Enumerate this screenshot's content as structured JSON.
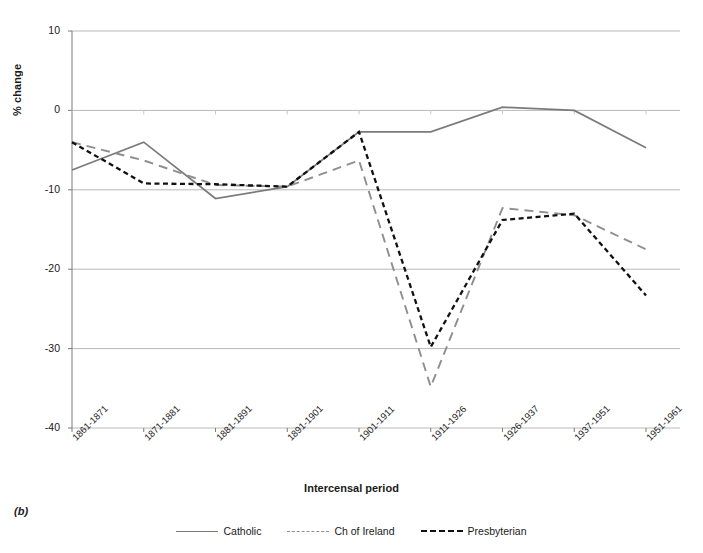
{
  "panel": {
    "letter": "(b)"
  },
  "chart_data": {
    "type": "line",
    "title": "",
    "xlabel": "Intercensal period",
    "ylabel": "% change",
    "categories": [
      "1861-1871",
      "1871-1881",
      "1881-1891",
      "1891-1901",
      "1901-1911",
      "1911-1926",
      "1926-1937",
      "1937-1951",
      "1951-1961"
    ],
    "ylim": [
      -40,
      10
    ],
    "yticks": [
      10,
      0,
      -10,
      -20,
      -30,
      -40
    ],
    "ytick_labels": [
      "10",
      "0",
      "-10",
      "-20",
      "-30",
      "-40"
    ],
    "grid": "horizontal",
    "legend_position": "bottom",
    "series": [
      {
        "name": "Catholic",
        "style": "solid",
        "color": "#7b7b7b",
        "values": [
          -7.5,
          -4.0,
          -11.1,
          -9.6,
          -2.7,
          -2.7,
          0.4,
          0.0,
          -4.7
        ]
      },
      {
        "name": "Ch of Ireland",
        "style": "dashed",
        "color": "#8e8e8e",
        "values": [
          -4.0,
          -6.3,
          -9.4,
          -9.6,
          -6.3,
          -34.8,
          -12.3,
          -13.2,
          -17.5
        ]
      },
      {
        "name": "Presbyterian",
        "style": "dotted-dash",
        "color": "#111111",
        "values": [
          -4.0,
          -9.2,
          -9.3,
          -9.6,
          -2.7,
          -29.8,
          -13.8,
          -13.0,
          -23.3
        ]
      }
    ]
  },
  "colors": {
    "axis": "#7a7a7a",
    "grid": "#b9b9b9",
    "text": "#1a1a1a"
  }
}
